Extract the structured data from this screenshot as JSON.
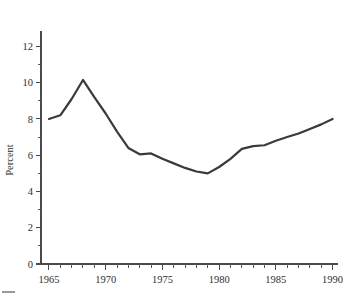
{
  "chart_data": {
    "type": "line",
    "title": "",
    "subtitle": "",
    "xlabel": "",
    "ylabel": "Percent",
    "xlim": [
      1964.3,
      1990.3
    ],
    "ylim": [
      0,
      12.85
    ],
    "grid": false,
    "legend": null,
    "legend_position": "none",
    "line_color": "#3a3a3a",
    "x_ticks_major": [
      1965,
      1970,
      1975,
      1980,
      1985,
      1990
    ],
    "x_tick_labels": [
      "1965",
      "1970",
      "1975",
      "1980",
      "1985",
      "1990"
    ],
    "x_tick_minor_step": 1,
    "y_ticks_major": [
      0,
      2,
      4,
      6,
      8,
      10,
      12
    ],
    "y_tick_labels": [
      "0",
      "2",
      "4",
      "6",
      "8",
      "10",
      "12"
    ],
    "y_tick_minor": [
      1,
      3,
      5,
      7,
      9,
      11
    ],
    "x": [
      1965,
      1966,
      1967,
      1968,
      1969,
      1970,
      1971,
      1972,
      1973,
      1974,
      1975,
      1976,
      1977,
      1978,
      1979,
      1980,
      1981,
      1982,
      1983,
      1984,
      1985,
      1986,
      1987,
      1988,
      1989,
      1990
    ],
    "values": [
      8.0,
      8.2,
      9.1,
      10.15,
      9.2,
      8.3,
      7.3,
      6.4,
      6.05,
      6.1,
      5.8,
      5.55,
      5.3,
      5.1,
      5.0,
      5.35,
      5.8,
      6.35,
      6.5,
      6.55,
      6.8,
      7.0,
      7.2,
      7.45,
      7.7,
      8.0
    ],
    "series": [
      {
        "name": "Percent",
        "values": [
          8.0,
          8.2,
          9.1,
          10.15,
          9.2,
          8.3,
          7.3,
          6.4,
          6.05,
          6.1,
          5.8,
          5.55,
          5.3,
          5.1,
          5.0,
          5.35,
          5.8,
          6.35,
          6.5,
          6.55,
          6.8,
          7.0,
          7.2,
          7.45,
          7.7,
          8.0
        ]
      }
    ],
    "annotations": []
  },
  "caption": {
    "text": ""
  }
}
